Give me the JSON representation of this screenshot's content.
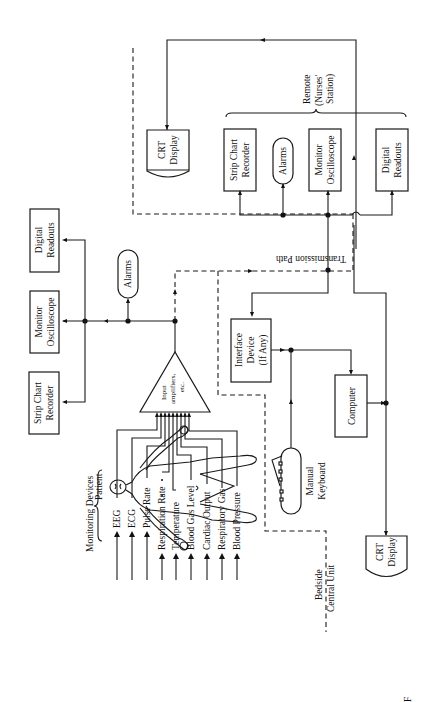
{
  "figure": {
    "orientation": "rotated 90 degrees counter-clockwise",
    "caption_fragment": "F"
  },
  "patient": {
    "label": "Patient"
  },
  "monitoring_devices": {
    "group_label": "Monitoring Devices",
    "signals": [
      {
        "label": "EEG"
      },
      {
        "label": "ECG"
      },
      {
        "label": "Pulse Rate"
      },
      {
        "label": "Respiration Rate"
      },
      {
        "label": "Temperature"
      },
      {
        "label": "Blood Gas Level"
      },
      {
        "label": "Cardiac Output"
      },
      {
        "label": "Respiratory Gas"
      },
      {
        "label": "Blood Pressure"
      }
    ]
  },
  "amplifier": {
    "line1": "Input",
    "line2": "amplifiers,",
    "line3": "etc."
  },
  "bedside_local": {
    "strip_chart": {
      "line1": "Strip Chart",
      "line2": "Recorder"
    },
    "monitor_scope": {
      "line1": "Monitor",
      "line2": "Oscilloscope"
    },
    "digital_readouts": {
      "line1": "Digital",
      "line2": "Readouts"
    },
    "alarms": {
      "label": "Alarms"
    }
  },
  "transmission": {
    "label": "Transmission Path"
  },
  "central_unit": {
    "region_label_1": "Bedside",
    "region_label_2": "Central Unit",
    "interface": {
      "line1": "Interface",
      "line2": "Device",
      "line3": "(If Any)"
    },
    "computer": {
      "label": "Computer"
    },
    "keyboard": {
      "line1": "Manual",
      "line2": "Keyboard"
    },
    "crt_bottom": {
      "line1": "CRT",
      "line2": "Display"
    },
    "crt_top": {
      "line1": "CRT",
      "line2": "Display"
    }
  },
  "remote": {
    "group_line1": "Remote",
    "group_line2": "(Nurses'",
    "group_line3": "Station)",
    "strip_chart": {
      "line1": "Strip Chart",
      "line2": "Recorder"
    },
    "alarms": {
      "label": "Alarms"
    },
    "monitor_scope": {
      "line1": "Monitor",
      "line2": "Oscilloscope"
    },
    "digital_readouts": {
      "line1": "Digital",
      "line2": "Readouts"
    }
  }
}
